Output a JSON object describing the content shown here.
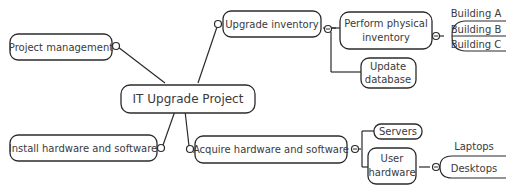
{
  "diagram": {
    "type": "mind-map",
    "central": {
      "label": "IT Upgrade Project"
    },
    "branches": [
      {
        "id": "project-management",
        "label": "Project management",
        "children": []
      },
      {
        "id": "install",
        "label": "Install hardware and software",
        "children": []
      },
      {
        "id": "upgrade-inventory",
        "label": "Upgrade inventory",
        "children": [
          {
            "id": "perform-physical-inventory",
            "label_line1": "Perform physical",
            "label_line2": "inventory",
            "children": [
              "Building A",
              "Building B",
              "Building C"
            ]
          },
          {
            "id": "update-database",
            "label_line1": "Update",
            "label_line2": "database",
            "children": []
          }
        ]
      },
      {
        "id": "acquire",
        "label": "Acquire hardware and software",
        "children": [
          {
            "id": "servers",
            "label": "Servers",
            "children": []
          },
          {
            "id": "user-hardware",
            "label_line1": "User",
            "label_line2": "hardware",
            "children": [
              "Laptops",
              "Desktops"
            ]
          }
        ]
      }
    ]
  }
}
